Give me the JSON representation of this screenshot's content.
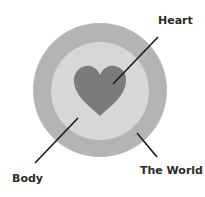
{
  "diagram": {
    "type": "concentric-circles",
    "layers": [
      {
        "name": "The World",
        "color": "#b4b4b4"
      },
      {
        "name": "Body",
        "color": "#d7d7d7"
      },
      {
        "name": "Heart",
        "color": "#7b7b7b"
      }
    ],
    "labels": {
      "heart": "Heart",
      "body": "Body",
      "world": "The World"
    },
    "line_color": "#1a1a1a"
  }
}
